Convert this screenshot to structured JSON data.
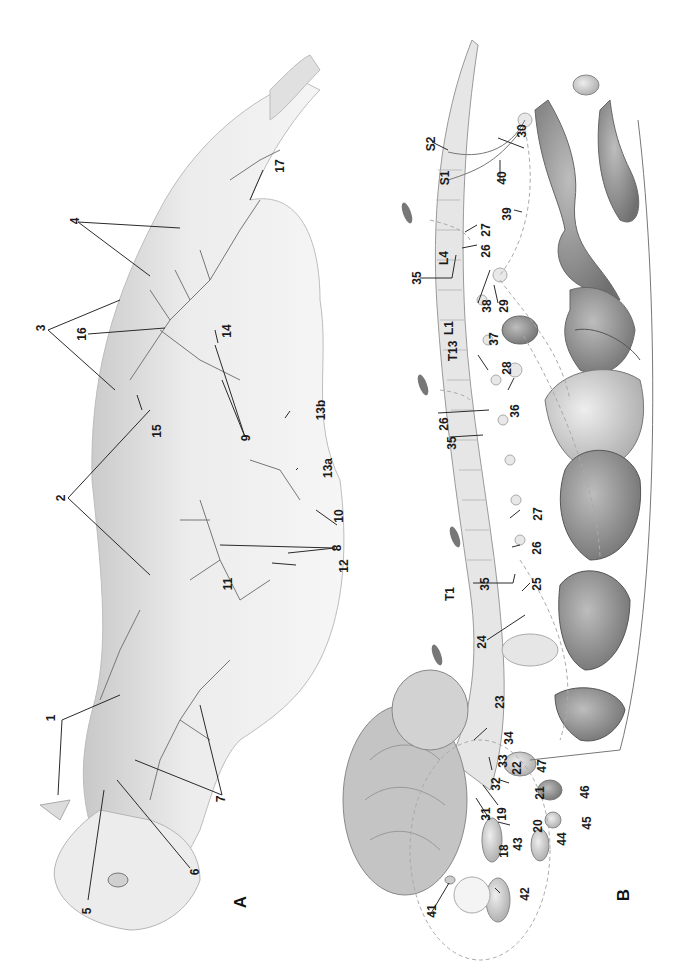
{
  "figure": {
    "panels": [
      {
        "id": "A",
        "label": "A",
        "subject": "cat body surface, lateral view with cutaneous nerve branches"
      },
      {
        "id": "B",
        "label": "B",
        "subject": "brain, spinal cord and autonomic innervation of viscera"
      }
    ],
    "panel_a_labels": {
      "l1": "1",
      "l2": "2",
      "l3": "3",
      "l4": "4",
      "l5": "5",
      "l6": "6",
      "l7": "7",
      "l8": "8",
      "l9": "9",
      "l10": "10",
      "l11": "11",
      "l12": "12",
      "l13a": "13a",
      "l13b": "13b",
      "l14": "14",
      "l15": "15",
      "l16": "16",
      "l17": "17"
    },
    "panel_b_labels": {
      "l18": "18",
      "l19": "19",
      "l20": "20",
      "l21": "21",
      "l22": "22",
      "l23": "23",
      "l24": "24",
      "l25": "25",
      "l26a": "26",
      "l26b": "26",
      "l26c": "26",
      "l27a": "27",
      "l27b": "27",
      "l28": "28",
      "l29": "29",
      "l30": "30",
      "l31": "31",
      "l32": "32",
      "l33": "33",
      "l34": "34",
      "l35a": "35",
      "l35b": "35",
      "l35c": "35",
      "l36": "36",
      "l37": "37",
      "l38": "38",
      "l39": "39",
      "l40": "40",
      "l41": "41",
      "l42": "42",
      "l43": "43",
      "l44": "44",
      "l45": "45",
      "l46": "46",
      "l47": "47"
    },
    "vertebra_labels": {
      "t1": "T1",
      "t13": "T13",
      "l1": "L1",
      "l4": "L4",
      "s1": "S1",
      "s2": "S2"
    },
    "colors": {
      "line": "#2a2a2a",
      "fur": "#cfcfcf",
      "nerve": "#6e6e6e",
      "organ_dark": "#7a7a7a",
      "organ_mid": "#a3a3a3",
      "organ_light": "#d8d8d8",
      "spine": "#e4e4e4"
    }
  }
}
